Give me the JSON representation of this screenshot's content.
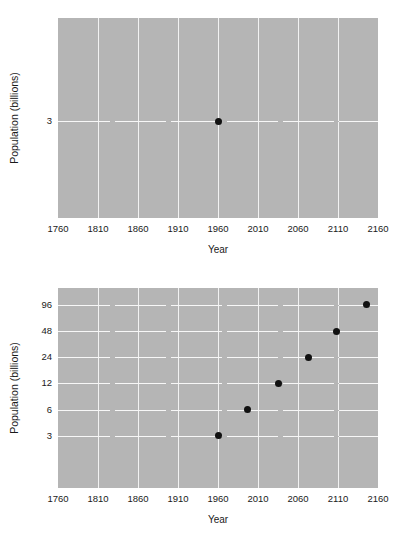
{
  "chart_data": [
    {
      "id": "top",
      "type": "scatter",
      "title": "",
      "xlabel": "Year",
      "ylabel": "Population (billions)",
      "xlim": [
        1760,
        2160
      ],
      "xticks": [
        1760,
        1810,
        1860,
        1910,
        1960,
        2010,
        2060,
        2110,
        2160
      ],
      "xtick_labels": [
        "1760",
        "1810",
        "1860",
        "1910",
        "1960",
        "2010",
        "2060",
        "2110",
        "2160"
      ],
      "yscale": "linear",
      "yticks": [
        3
      ],
      "ytick_labels": [
        "3"
      ],
      "ylim": [
        0,
        6.2
      ],
      "grid": true,
      "legend": false,
      "points": [
        {
          "x": 1960,
          "y": 3,
          "label": "3"
        }
      ],
      "marker_color": "#111111",
      "plot_background": "#b5b5b5",
      "grid_color": "#f2f2f2"
    },
    {
      "id": "bottom",
      "type": "scatter",
      "title": "",
      "xlabel": "Year",
      "ylabel": "Population (billions)",
      "xlim": [
        1760,
        2160
      ],
      "xticks": [
        1760,
        1810,
        1860,
        1910,
        1960,
        2010,
        2060,
        2110,
        2160
      ],
      "xtick_labels": [
        "1760",
        "1810",
        "1860",
        "1910",
        "1960",
        "2010",
        "2060",
        "2110",
        "2160"
      ],
      "yscale": "log2",
      "yticks": [
        3,
        6,
        12,
        24,
        48,
        96
      ],
      "ytick_labels": [
        "96",
        "48",
        "24",
        "12",
        "6",
        "3"
      ],
      "ylim": [
        0.75,
        150
      ],
      "grid": true,
      "legend": false,
      "points": [
        {
          "x": 1960,
          "y": 3,
          "label": "3"
        },
        {
          "x": 1997,
          "y": 6,
          "label": "6"
        },
        {
          "x": 2035,
          "y": 12,
          "label": "12"
        },
        {
          "x": 2073,
          "y": 24,
          "label": "24"
        },
        {
          "x": 2108,
          "y": 48,
          "label": "48"
        },
        {
          "x": 2145,
          "y": 96,
          "label": "96"
        }
      ],
      "marker_color": "#111111",
      "plot_background": "#b5b5b5",
      "grid_color": "#f2f2f2"
    }
  ],
  "charts": {
    "top": {
      "xlabel": "Year",
      "ylabel": "Population (billions)",
      "xticks": [
        "1760",
        "1810",
        "1860",
        "1910",
        "1960",
        "2010",
        "2060",
        "2110",
        "2160"
      ],
      "yticks": [
        "3"
      ]
    },
    "bottom": {
      "xlabel": "Year",
      "ylabel": "Population (billions)",
      "xticks": [
        "1760",
        "1810",
        "1860",
        "1910",
        "1960",
        "2010",
        "2060",
        "2110",
        "2160"
      ],
      "yticks": [
        "96",
        "48",
        "24",
        "12",
        "6",
        "3"
      ]
    }
  }
}
